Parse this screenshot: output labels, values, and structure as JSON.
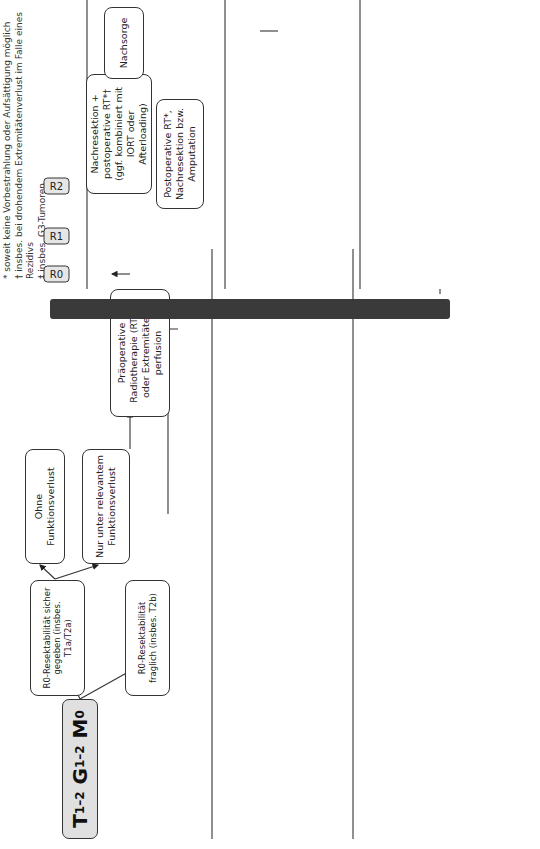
{
  "footnotes": [
    "* soweit keine Vorbestrahlung oder Aufsättigung möglich",
    "† insbes. bei drohendem Extremitätenverlust im Falle eines Rezidivs",
    "‡ insbes. G3-Tumoren"
  ],
  "resection_bar": {
    "letters": [
      "R",
      "E",
      "S",
      "E",
      "K",
      "T",
      "I",
      "O",
      "N"
    ]
  },
  "stages": [
    {
      "id": "t12g12m0",
      "T": "T",
      "T_sub": "1–2",
      "G": "G",
      "G_sub": "1–2",
      "M": "M",
      "M_sub": "0"
    },
    {
      "id": "t12g23m0",
      "T": "T",
      "T_sub": "1–2",
      "G": "G",
      "G_sub": "2/3",
      "M": "M",
      "M_sub": "0"
    },
    {
      "id": "txm1",
      "T": "T",
      "T_sub": "x",
      "M": "M",
      "M_sub": "1"
    }
  ],
  "section1": {
    "pre": {
      "r0_sicher": "R0-Resektabilität sicher gegeben (insbes. T1a/T2a)",
      "r0_fraglich": "R0-Resektabilität fraglich (insbes. T2b)",
      "ohne_verlust": "Ohne Funktionsverlust",
      "nur_verlust": "Nur unter relevantem Funktionsverlust",
      "praeop_rt": "Präoperative Radiotherapie (RT) ± oder Extremitäten-perfusion"
    },
    "tags": [
      "R0",
      "R1",
      "R2"
    ],
    "post": {
      "r1": "Nachresektion + postoperative RT*† (ggf. kombiniert mit IORT oder Afterloading)",
      "r2": "Postoperative RT*, Nachresektion bzw. Amputation",
      "nachsorge": "Nachsorge"
    }
  },
  "section2": {
    "pre": {
      "r0_sicher": "R0-Resektion sicher möglich",
      "r0_fraglich": "R0-Resektabilität fraglich",
      "praeop_rt": "Präoperative RT ± Chemotherapie oder Extremitätenperfusion"
    },
    "tags": [
      "R0",
      "R1",
      "R2"
    ],
    "post": {
      "r0": "Adjuvante Chemotherapie ‡",
      "r1": "Nachresektion oder RT*",
      "r2": "RT* ± Nachresektion bzw. Amputation",
      "additive": "Additive Chemotherapie",
      "nachsorge": "Nachsorge"
    }
  },
  "section3": {
    "pre": {
      "induktion": "Induktions-chemotherapie",
      "ansprechen": "Bei Ansprechen: Tumorresektion, wenn R0 erreichbar",
      "nicht_gegeben": "R0-Resektabilität nicht gegeben",
      "progress": "Progress unter Induktions-chemotherapie"
    },
    "tags": [
      "R0",
      "R1"
    ],
    "post": {
      "r0": "Metastasen-resektion",
      "r1": "Lokale RT und Metastasen-resektion",
      "ggf_additive": "Ggf. additive Chemotherapie",
      "nachsorge": "Nachsorge",
      "fortsetzung": "Fortsetzung der Chemotherapie ± RT bis Progress",
      "palliative": "Palliative Second-Line-Chemotherapie"
    }
  }
}
